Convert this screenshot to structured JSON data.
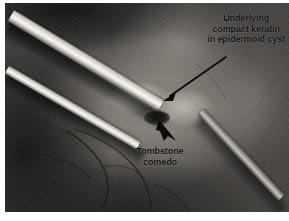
{
  "figure": {
    "kind": "clinical-photograph",
    "modality": "intraoperative grayscale photograph",
    "width": 289,
    "height": 221
  },
  "annotations": [
    {
      "id": "keratin",
      "name": "annotation-keratin",
      "lines": [
        "Underlying",
        "compact keratin",
        "in epidermoid cyst"
      ],
      "text": "Underlying compact keratin in epidermoid cyst",
      "arrow": {
        "style": "thin-line-with-head",
        "from": [
          226,
          57
        ],
        "to": [
          163,
          101
        ],
        "direction": "down-left"
      }
    },
    {
      "id": "comedo",
      "name": "annotation-comedo",
      "lines": [
        "Tombstone",
        "comedo"
      ],
      "text": "Tombstone comedo",
      "arrow": {
        "style": "short-thick-head",
        "from": [
          176,
          141
        ],
        "to": [
          159,
          120
        ],
        "direction": "up-left"
      }
    }
  ],
  "scene": {
    "instruments": [
      {
        "name": "forceps-blade-upper",
        "appearance": "bright metal blade entering from upper left"
      },
      {
        "name": "forceps-blade-lower",
        "appearance": "bright metal blade entering from left"
      },
      {
        "name": "probe",
        "appearance": "dull metal probe entering from lower right"
      }
    ],
    "structures": [
      {
        "name": "epidermoid-cyst",
        "appearance": "pale nodular mass at center"
      },
      {
        "name": "tombstone-comedo",
        "appearance": "dark punctate opening below the cyst"
      },
      {
        "name": "skin-and-vessels",
        "appearance": "dark surrounding skin with fine vessels and suture threads"
      }
    ]
  },
  "colors": {
    "annotation_text": "#0c0c0c",
    "arrow": "#0b0b0b",
    "page_background": "#ffffff",
    "lesion_highlight": "#d8d3c9",
    "tissue_mid": "#807b74",
    "tissue_dark": "#3c3a38",
    "instrument_metal": "#ffffff"
  }
}
